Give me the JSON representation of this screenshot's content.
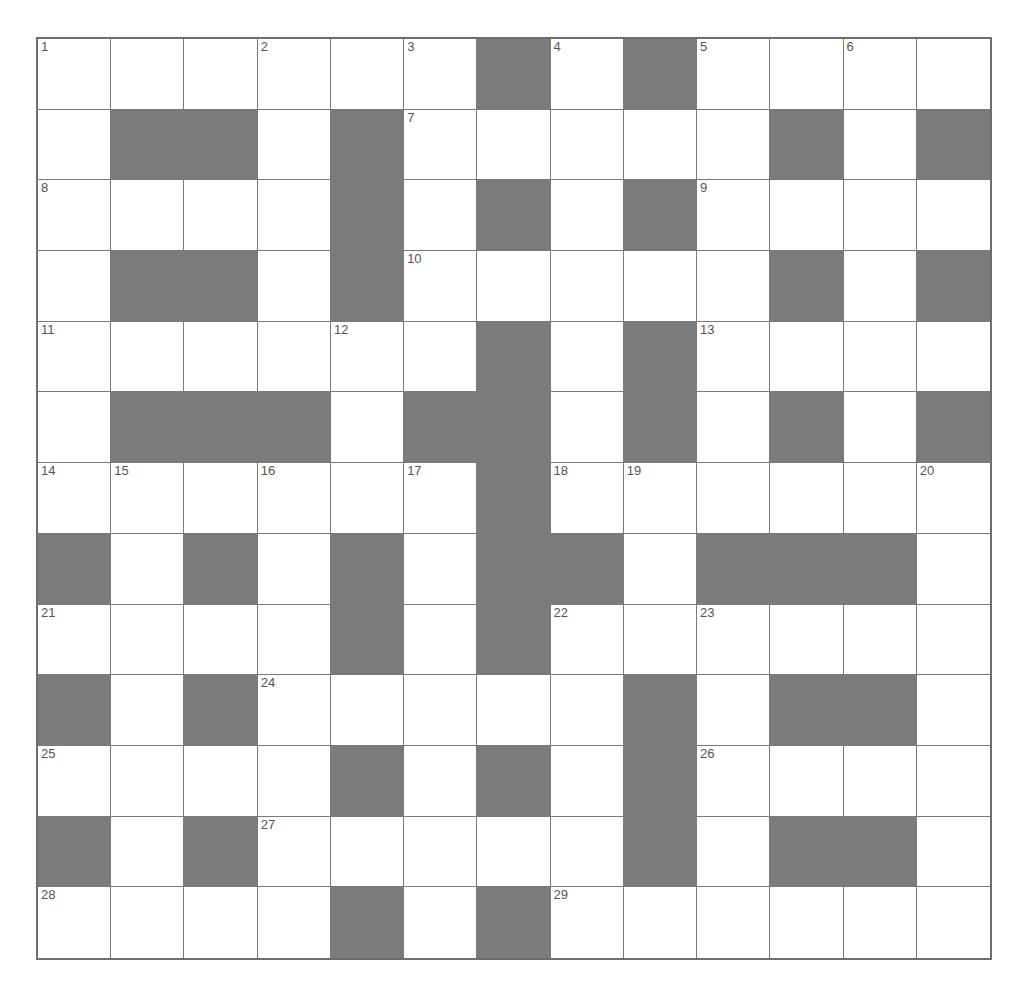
{
  "puzzle": {
    "rows": 13,
    "cols": 13,
    "colors": {
      "block": "#7b7b7b",
      "cell": "#ffffff",
      "grid_line": "#7a7a7a",
      "number": "#555555"
    },
    "grid": [
      ".......#.#....",
      "placeholder"
    ],
    "layout": [
      "......#.#....",
      ".##.#.....#.#",
      "....#.#.#....",
      ".##.#.....#.#",
      "......#.#....",
      ".###.##.#.#.#",
      "......#......",
      "#.#.#.##.###.",
      "....#.#......",
      "#.#.....#.##.",
      "....#.#.#....",
      "#.#.....#.##.",
      "....#.#......"
    ],
    "numbers": [
      {
        "r": 0,
        "c": 0,
        "n": "1"
      },
      {
        "r": 0,
        "c": 3,
        "n": "2"
      },
      {
        "r": 0,
        "c": 5,
        "n": "3"
      },
      {
        "r": 0,
        "c": 7,
        "n": "4"
      },
      {
        "r": 0,
        "c": 9,
        "n": "5"
      },
      {
        "r": 0,
        "c": 11,
        "n": "6"
      },
      {
        "r": 1,
        "c": 5,
        "n": "7"
      },
      {
        "r": 2,
        "c": 0,
        "n": "8"
      },
      {
        "r": 2,
        "c": 9,
        "n": "9"
      },
      {
        "r": 3,
        "c": 5,
        "n": "10"
      },
      {
        "r": 4,
        "c": 0,
        "n": "11"
      },
      {
        "r": 4,
        "c": 4,
        "n": "12"
      },
      {
        "r": 4,
        "c": 9,
        "n": "13"
      },
      {
        "r": 6,
        "c": 0,
        "n": "14"
      },
      {
        "r": 6,
        "c": 1,
        "n": "15"
      },
      {
        "r": 6,
        "c": 3,
        "n": "16"
      },
      {
        "r": 6,
        "c": 5,
        "n": "17"
      },
      {
        "r": 6,
        "c": 7,
        "n": "18"
      },
      {
        "r": 6,
        "c": 8,
        "n": "19"
      },
      {
        "r": 6,
        "c": 12,
        "n": "20"
      },
      {
        "r": 8,
        "c": 0,
        "n": "21"
      },
      {
        "r": 8,
        "c": 7,
        "n": "22"
      },
      {
        "r": 8,
        "c": 9,
        "n": "23"
      },
      {
        "r": 9,
        "c": 3,
        "n": "24"
      },
      {
        "r": 10,
        "c": 0,
        "n": "25"
      },
      {
        "r": 10,
        "c": 9,
        "n": "26"
      },
      {
        "r": 11,
        "c": 3,
        "n": "27"
      },
      {
        "r": 12,
        "c": 0,
        "n": "28"
      },
      {
        "r": 12,
        "c": 7,
        "n": "29"
      }
    ],
    "entries": {}
  }
}
